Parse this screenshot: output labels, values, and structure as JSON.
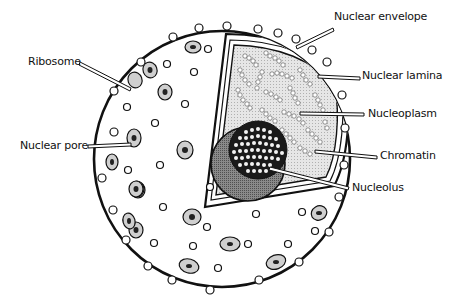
{
  "diagram": {
    "colors": {
      "outline": "#111111",
      "background": "#ffffff",
      "nucleoplasm": "#dcdcdc",
      "nucleolus_dark": "#6e6e6e",
      "nucleolus_core": "#1a1a1a",
      "pore_fill": "#c8c8c8"
    },
    "labels": [
      {
        "id": "nuclear-envelope",
        "text": "Nuclear envelope",
        "x": 334,
        "y": 17
      },
      {
        "id": "nuclear-lamina",
        "text": "Nuclear lamina",
        "x": 363,
        "y": 68
      },
      {
        "id": "nucleoplasm",
        "text": "Nucleoplasm",
        "x": 369,
        "y": 108
      },
      {
        "id": "chromatin",
        "text": "Chromatin",
        "x": 380,
        "y": 149
      },
      {
        "id": "nucleolus",
        "text": "Nucleolus",
        "x": 353,
        "y": 182
      },
      {
        "id": "ribosome",
        "text": "Ribosome",
        "x": 28,
        "y": 54
      },
      {
        "id": "nuclear-pore",
        "text": "Nuclear pore",
        "x": 22,
        "y": 138
      }
    ]
  }
}
